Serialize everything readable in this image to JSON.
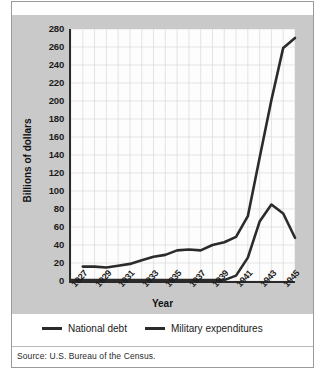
{
  "figure": {
    "source_note": "Source: U.S. Bureau of the Census.",
    "panel_color": "#c9c9c9",
    "plot_background": "#fdfdfd",
    "line_color": "#2b2b2b"
  },
  "legend": {
    "position": "bottom-left",
    "entries": [
      {
        "label": "National debt",
        "swatch_name": "national-debt-swatch"
      },
      {
        "label": "Military expenditures",
        "swatch_name": "military-expenditures-swatch"
      }
    ]
  },
  "chart_data": {
    "type": "line",
    "title": "",
    "xlabel": "Year",
    "ylabel": "Billions of dollars",
    "xlim": [
      1927,
      1946
    ],
    "ylim": [
      0,
      280
    ],
    "ytick_step": 20,
    "yticks": [
      0,
      20,
      40,
      60,
      80,
      100,
      120,
      140,
      160,
      180,
      200,
      220,
      240,
      260,
      280
    ],
    "ytick_labels": [
      "0",
      "20",
      "40",
      "60",
      "80",
      "100",
      "120",
      "140",
      "160",
      "180",
      "200",
      "220",
      "240",
      "260",
      "280"
    ],
    "xticks": [
      1927,
      1929,
      1931,
      1933,
      1935,
      1937,
      1939,
      1941,
      1943,
      1945
    ],
    "xtick_labels": [
      "1927",
      "1929",
      "1931",
      "1933",
      "1935",
      "1937",
      "1939",
      "1941",
      "1943",
      "1945"
    ],
    "xtick_rotation": -48,
    "grid": true,
    "grid_color": "#d8d8d8",
    "legend_position": "bottom",
    "x": [
      1927,
      1928,
      1929,
      1930,
      1931,
      1932,
      1933,
      1934,
      1935,
      1936,
      1937,
      1938,
      1939,
      1940,
      1941,
      1942,
      1943,
      1944,
      1945,
      1946
    ],
    "series": [
      {
        "name": "National debt",
        "color": "#2b2b2b",
        "values": [
          null,
          16,
          16,
          15,
          17,
          19,
          23,
          27,
          29,
          34,
          35,
          34,
          40,
          43,
          49,
          72,
          137,
          201,
          259,
          270
        ]
      },
      {
        "name": "Military expenditures",
        "color": "#2b2b2b",
        "values": [
          1,
          1,
          1,
          1,
          1,
          1,
          1,
          1,
          1,
          1,
          1,
          1,
          1,
          1,
          6,
          26,
          66,
          85,
          75,
          48
        ]
      }
    ]
  }
}
